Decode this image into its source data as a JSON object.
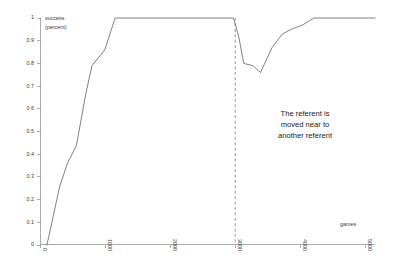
{
  "chart_data": {
    "type": "line",
    "title": "",
    "xlabel": "games",
    "ylabel": "success (percent)",
    "ylabel_line1": "success",
    "ylabel_line2": "(percent)",
    "xlim": [
      0,
      5200
    ],
    "ylim": [
      0,
      1
    ],
    "grid": false,
    "legend": false,
    "xticks": [
      0,
      1000,
      2000,
      3000,
      4000,
      5000
    ],
    "xtick_labels": [
      "0",
      "1000",
      "2000",
      "3000",
      "4000",
      "5000"
    ],
    "yticks": [
      0,
      0.1,
      0.2,
      0.3,
      0.4,
      0.5,
      0.6,
      0.7,
      0.8,
      0.9,
      1
    ],
    "ytick_labels": [
      "0",
      "0.1",
      "0.2",
      "0.3",
      "0.4",
      "0.5",
      "0.6",
      "0.7",
      "0.8",
      "0.9",
      "1"
    ],
    "xtick_rotation": 90,
    "series": [
      {
        "name": "success rate",
        "color": "#555555",
        "x": [
          100,
          300,
          420,
          560,
          700,
          800,
          1000,
          1160,
          3000,
          3080,
          3160,
          3300,
          3420,
          3600,
          3760,
          3900,
          4080,
          4250,
          5200
        ],
        "y": [
          0.0,
          0.26,
          0.36,
          0.44,
          0.66,
          0.79,
          0.86,
          1.0,
          1.0,
          0.92,
          0.8,
          0.79,
          0.76,
          0.87,
          0.93,
          0.95,
          0.97,
          1.0,
          1.0
        ]
      }
    ],
    "annotations": [
      {
        "name": "event-marker",
        "type": "vline",
        "x": 3000,
        "style": "dashed",
        "color": "#777777"
      },
      {
        "name": "event-description",
        "type": "text",
        "x": 3780,
        "y": 0.5,
        "lines": [
          "The referent is",
          "moved near to",
          "another referent"
        ]
      }
    ]
  }
}
